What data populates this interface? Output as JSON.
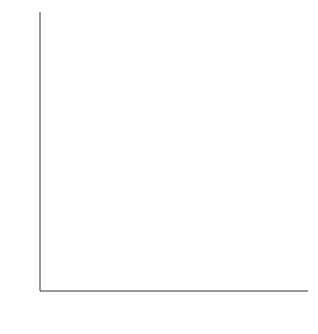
{
  "chart_data": {
    "type": "scatter",
    "title": "",
    "xlabel": "Score on red die x",
    "ylabel": "Total score y",
    "xlim": [
      0.45,
      6.45
    ],
    "ylim": [
      0,
      12.45
    ],
    "xticks": [
      1,
      2,
      3,
      4,
      5,
      6
    ],
    "yticks": [
      1,
      2,
      3,
      4,
      5,
      6,
      7,
      8,
      9,
      10,
      11,
      12
    ],
    "xticklabels": [
      "1",
      "2",
      "3",
      "4",
      "5",
      "6"
    ],
    "yticklabels": [
      "1",
      "2",
      "3",
      "4",
      "5",
      "6",
      "7",
      "8",
      "9",
      "10",
      "11",
      "12"
    ],
    "grid": false,
    "legend": false,
    "series": [
      {
        "name": "Observations",
        "marker": "filled-dot",
        "points": [
          {
            "x": 1,
            "y": 2
          },
          {
            "x": 1,
            "y": 3
          },
          {
            "x": 1,
            "y": 4
          },
          {
            "x": 1,
            "y": 5
          },
          {
            "x": 1,
            "y": 6
          },
          {
            "x": 1,
            "y": 7
          },
          {
            "x": 2,
            "y": 3
          },
          {
            "x": 2,
            "y": 4
          },
          {
            "x": 2,
            "y": 5
          },
          {
            "x": 2,
            "y": 6
          },
          {
            "x": 2,
            "y": 7
          },
          {
            "x": 2,
            "y": 8
          },
          {
            "x": 3,
            "y": 4
          },
          {
            "x": 3,
            "y": 5
          },
          {
            "x": 3,
            "y": 6
          },
          {
            "x": 3,
            "y": 7
          },
          {
            "x": 3,
            "y": 8
          },
          {
            "x": 3,
            "y": 9
          },
          {
            "x": 4,
            "y": 5
          },
          {
            "x": 4,
            "y": 6
          },
          {
            "x": 4,
            "y": 7
          },
          {
            "x": 4,
            "y": 8
          },
          {
            "x": 4,
            "y": 9
          },
          {
            "x": 4,
            "y": 10
          },
          {
            "x": 5,
            "y": 6
          },
          {
            "x": 5,
            "y": 7
          },
          {
            "x": 5,
            "y": 8
          },
          {
            "x": 5,
            "y": 9
          },
          {
            "x": 5,
            "y": 10
          },
          {
            "x": 5,
            "y": 11
          },
          {
            "x": 6,
            "y": 7
          },
          {
            "x": 6,
            "y": 8
          },
          {
            "x": 6,
            "y": 9
          },
          {
            "x": 6,
            "y": 10
          },
          {
            "x": 6,
            "y": 11
          },
          {
            "x": 6,
            "y": 12
          }
        ]
      },
      {
        "name": "Column means",
        "marker": "open-circle",
        "points": [
          {
            "x": 1,
            "y": 4.5
          },
          {
            "x": 2,
            "y": 5.5
          },
          {
            "x": 3,
            "y": 6.5
          },
          {
            "x": 4,
            "y": 7.5
          },
          {
            "x": 5,
            "y": 8.5
          },
          {
            "x": 6,
            "y": 9.5
          }
        ]
      },
      {
        "name": "Regression line",
        "marker": "dashed-line",
        "points": [
          {
            "x": 1,
            "y": 4.5
          },
          {
            "x": 6,
            "y": 9.5
          }
        ]
      }
    ]
  },
  "colors": {
    "dot": "#111111",
    "mean_marker_stroke": "#111111",
    "mean_marker_fill": "#ffffff",
    "line": "#111111",
    "axis": "#333333",
    "text": "#1a1a1a",
    "background": "#ffffff"
  }
}
